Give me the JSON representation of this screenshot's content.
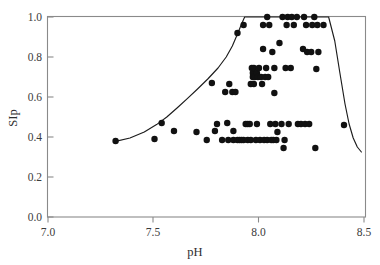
{
  "chart_data": {
    "type": "scatter",
    "title": "",
    "xlabel": "pH",
    "ylabel": "SIp",
    "xlim": [
      7.0,
      8.55
    ],
    "ylim": [
      0.0,
      1.04
    ],
    "grid": false,
    "legend": null,
    "xticks": [
      "7.0",
      "7.5",
      "8.0",
      "8.5"
    ],
    "xtick_values": [
      7.0,
      7.5,
      8.0,
      8.5
    ],
    "yticks": [
      "0.0",
      "0.2",
      "0.4",
      "0.6",
      "0.8",
      "1.0"
    ],
    "ytick_values": [
      0.0,
      0.2,
      0.4,
      0.6,
      0.8,
      1.0
    ],
    "marker": "filled-circle",
    "marker_color": "#111111",
    "marker_size_px": 6.4,
    "curve_color": "#1c1c1c",
    "points": [
      [
        7.33,
        0.38
      ],
      [
        7.52,
        0.39
      ],
      [
        7.555,
        0.47
      ],
      [
        7.615,
        0.43
      ],
      [
        7.725,
        0.425
      ],
      [
        7.775,
        0.385
      ],
      [
        7.8,
        0.67
      ],
      [
        7.815,
        0.43
      ],
      [
        7.825,
        0.465
      ],
      [
        7.85,
        0.385
      ],
      [
        7.865,
        0.625
      ],
      [
        7.875,
        0.47
      ],
      [
        7.88,
        0.385
      ],
      [
        7.885,
        0.665
      ],
      [
        7.9,
        0.625
      ],
      [
        7.905,
        0.43
      ],
      [
        7.905,
        0.385
      ],
      [
        7.915,
        0.625
      ],
      [
        7.925,
        0.385
      ],
      [
        7.925,
        0.92
      ],
      [
        7.935,
        0.385
      ],
      [
        7.945,
        0.385
      ],
      [
        7.955,
        0.385
      ],
      [
        7.955,
        0.96
      ],
      [
        7.965,
        0.465
      ],
      [
        7.975,
        0.465
      ],
      [
        7.975,
        0.385
      ],
      [
        7.985,
        0.465
      ],
      [
        7.99,
        0.385
      ],
      [
        7.99,
        0.665
      ],
      [
        7.995,
        0.745
      ],
      [
        8.0,
        0.72
      ],
      [
        8.0,
        0.7
      ],
      [
        8.005,
        0.745
      ],
      [
        8.005,
        0.665
      ],
      [
        8.01,
        0.7
      ],
      [
        8.015,
        0.385
      ],
      [
        8.02,
        0.72
      ],
      [
        8.02,
        0.465
      ],
      [
        8.025,
        0.7
      ],
      [
        8.03,
        0.745
      ],
      [
        8.035,
        0.385
      ],
      [
        8.04,
        0.7
      ],
      [
        8.045,
        0.665
      ],
      [
        8.05,
        0.96
      ],
      [
        8.05,
        0.84
      ],
      [
        8.055,
        0.385
      ],
      [
        8.06,
        0.7
      ],
      [
        8.065,
        0.745
      ],
      [
        8.07,
        1.0
      ],
      [
        8.07,
        0.385
      ],
      [
        8.075,
        0.7
      ],
      [
        8.08,
        0.96
      ],
      [
        8.085,
        0.465
      ],
      [
        8.09,
        0.385
      ],
      [
        8.095,
        0.825
      ],
      [
        8.1,
        0.385
      ],
      [
        8.105,
        0.745
      ],
      [
        8.105,
        0.62
      ],
      [
        8.11,
        0.465
      ],
      [
        8.115,
        0.385
      ],
      [
        8.12,
        0.425
      ],
      [
        8.13,
        0.87
      ],
      [
        8.14,
        0.465
      ],
      [
        8.145,
        1.0
      ],
      [
        8.15,
        0.345
      ],
      [
        8.155,
        0.385
      ],
      [
        8.16,
        0.745
      ],
      [
        8.165,
        0.96
      ],
      [
        8.17,
        1.0
      ],
      [
        8.175,
        0.465
      ],
      [
        8.185,
        0.745
      ],
      [
        8.19,
        1.0
      ],
      [
        8.2,
        0.96
      ],
      [
        8.215,
        1.0
      ],
      [
        8.22,
        0.465
      ],
      [
        8.235,
        0.465
      ],
      [
        8.245,
        0.84
      ],
      [
        8.25,
        1.0
      ],
      [
        8.255,
        0.465
      ],
      [
        8.26,
        0.96
      ],
      [
        8.265,
        0.825
      ],
      [
        8.275,
        0.465
      ],
      [
        8.285,
        0.825
      ],
      [
        8.29,
        0.96
      ],
      [
        8.3,
        1.0
      ],
      [
        8.305,
        0.345
      ],
      [
        8.31,
        0.74
      ],
      [
        8.315,
        0.96
      ],
      [
        8.32,
        0.825
      ],
      [
        8.345,
        0.96
      ],
      [
        8.445,
        0.46
      ]
    ],
    "curve": {
      "description": "Fitted response curve rising from SIp 0.38 at pH 7.33 to a plateau at SIp 1.00 between pH 7.95 and 8.37, then falling to SIp 0.32 at pH 8.53",
      "points": [
        [
          7.33,
          0.378
        ],
        [
          7.4,
          0.395
        ],
        [
          7.47,
          0.425
        ],
        [
          7.53,
          0.462
        ],
        [
          7.58,
          0.5
        ],
        [
          7.63,
          0.545
        ],
        [
          7.68,
          0.592
        ],
        [
          7.73,
          0.64
        ],
        [
          7.78,
          0.69
        ],
        [
          7.83,
          0.745
        ],
        [
          7.87,
          0.8
        ],
        [
          7.9,
          0.855
        ],
        [
          7.925,
          0.915
        ],
        [
          7.945,
          0.965
        ],
        [
          7.96,
          1.0
        ],
        [
          8.1,
          1.0
        ],
        [
          8.25,
          1.0
        ],
        [
          8.37,
          1.0
        ],
        [
          8.4,
          0.88
        ],
        [
          8.425,
          0.72
        ],
        [
          8.45,
          0.565
        ],
        [
          8.47,
          0.465
        ],
        [
          8.49,
          0.395
        ],
        [
          8.51,
          0.35
        ],
        [
          8.53,
          0.325
        ]
      ]
    }
  }
}
